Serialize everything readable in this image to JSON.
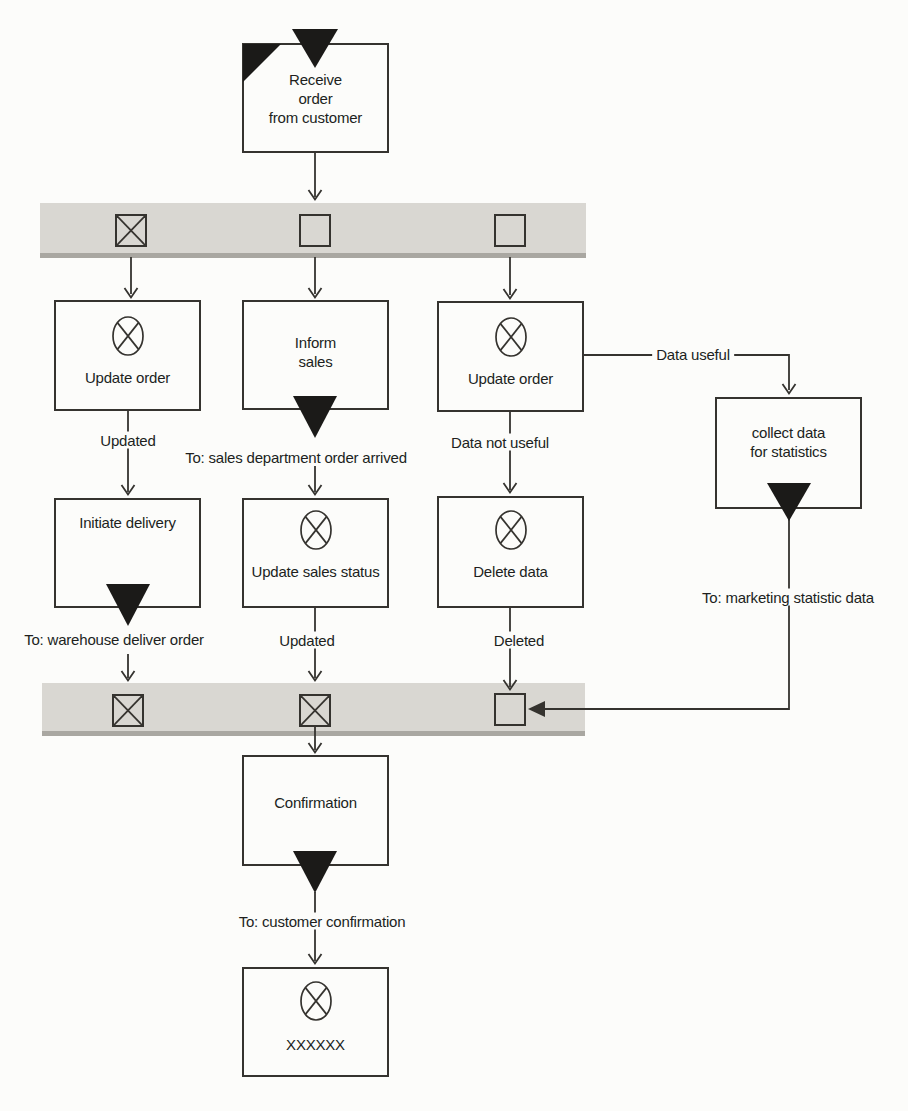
{
  "diagram_type": "flowchart-epc-order-process",
  "colors": {
    "background": "#fcfcfa",
    "line": "#35332f",
    "text": "#201f1d",
    "band_fill": "#d9d7d2",
    "band_edge": "#a9a7a1",
    "flag_fill": "#1b1a18"
  },
  "icons": {
    "crossed_circle": "⊗",
    "message_flag": "▼",
    "folded_corner": "◤",
    "crossed_box": "☒",
    "plain_box": "☐"
  },
  "nodes": {
    "receive_order": {
      "label": "Receive\norder\nfrom customer"
    },
    "update_order_left": {
      "label": "Update order"
    },
    "inform_sales": {
      "label": "Inform\nsales"
    },
    "update_order_right": {
      "label": "Update order"
    },
    "collect_data": {
      "label": "collect data\nfor statistics"
    },
    "initiate_delivery": {
      "label": "Initiate delivery"
    },
    "update_sales_status": {
      "label": "Update sales status"
    },
    "delete_data": {
      "label": "Delete data"
    },
    "confirmation": {
      "label": "Confirmation"
    },
    "final_state": {
      "label": "XXXXXX"
    }
  },
  "edge_labels": {
    "updated_left": "Updated",
    "to_sales_department": "To: sales department order arrived",
    "data_not_useful": "Data not useful",
    "data_useful": "Data useful",
    "to_warehouse": "To: warehouse deliver order",
    "updated_middle": "Updated",
    "deleted": "Deleted",
    "to_marketing": "To: marketing statistic data",
    "to_customer": "To: customer confirmation"
  }
}
